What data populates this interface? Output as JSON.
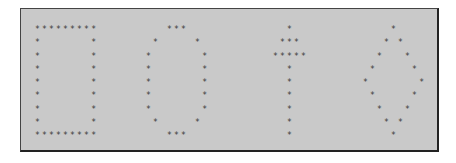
{
  "panel": {
    "glyphs": [
      {
        "name": "letter-d",
        "left": 14,
        "top": 14,
        "rows": [
          "*********",
          "*       *",
          "*       *",
          "*       *",
          "*       *",
          "*       *",
          "*       *",
          "*       *",
          "*********"
        ]
      },
      {
        "name": "letter-o",
        "left": 125,
        "top": 14,
        "rows": [
          "   ***   ",
          " *     * ",
          "*       *",
          "*       *",
          "*       *",
          "*       *",
          "*       *",
          " *     * ",
          "   ***   "
        ]
      },
      {
        "name": "arrow-up",
        "left": 252,
        "top": 14,
        "rows": [
          "  *  ",
          " *** ",
          "*****",
          "  *  ",
          "  *  ",
          "  *  ",
          "  *  ",
          "  *  ",
          "  *  "
        ]
      },
      {
        "name": "diamond",
        "left": 342,
        "top": 14,
        "rows": [
          "    *    ",
          "   * *   ",
          "  *   *  ",
          " *     * ",
          "*       *",
          " *     * ",
          "  *   *  ",
          "   * *   ",
          "    *    "
        ]
      }
    ]
  }
}
